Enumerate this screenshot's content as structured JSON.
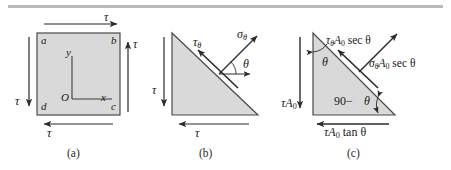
{
  "figure": {
    "type": "mechanics-stress-diagram",
    "top_rule": true,
    "background": "#ffffff",
    "shape_fill": "#d9d9d9",
    "shape_stroke": "#4a4a4a",
    "arrow_color": "#2b2b2b"
  },
  "panels": [
    {
      "id": "a",
      "caption": "(a)",
      "shape": "square",
      "corner_labels": {
        "top_left": "a",
        "top_right": "b",
        "bottom_right": "c",
        "bottom_left": "d"
      },
      "axes": {
        "origin_label": "O",
        "x_label": "x",
        "y_label": "y"
      },
      "arrows": [
        {
          "name": "top-shear-arrow",
          "direction": "right",
          "label": "τ"
        },
        {
          "name": "right-shear-arrow",
          "direction": "up",
          "label": "τ"
        },
        {
          "name": "bottom-shear-arrow",
          "direction": "left",
          "label": "τ"
        },
        {
          "name": "left-shear-arrow",
          "direction": "down",
          "label": "τ"
        }
      ]
    },
    {
      "id": "b",
      "caption": "(b)",
      "shape": "right-triangle",
      "arrows": [
        {
          "name": "left-shear-arrow",
          "direction": "down",
          "label": "τ"
        },
        {
          "name": "bottom-shear-arrow",
          "direction": "left",
          "label": "τ"
        },
        {
          "name": "tau-theta-arrow",
          "direction": "up-left",
          "label_greek": "τ",
          "label_sub": "θ"
        },
        {
          "name": "sigma-theta-arrow",
          "direction": "up-right",
          "label_greek": "σ",
          "label_sub": "θ"
        }
      ],
      "angle_label": "θ"
    },
    {
      "id": "c",
      "caption": "(c)",
      "shape": "right-triangle",
      "arrows": [
        {
          "name": "tau-a0-arrow",
          "direction": "down",
          "label_greek": "τ",
          "label_rest": "A",
          "label_sub": "0"
        },
        {
          "name": "tau-a0-tan-theta-arrow",
          "direction": "left",
          "label_greek": "τ",
          "label_rest": "A",
          "label_sub": "0",
          "label_tail": " tan θ"
        },
        {
          "name": "tau-theta-a0-sec-theta-arrow",
          "direction": "up-left",
          "label_greek": "τ",
          "label_sub_greek": "θ",
          "label_rest": "A",
          "label_sub": "0",
          "label_tail": " sec θ"
        },
        {
          "name": "sigma-theta-a0-sec-theta-arrow",
          "direction": "up-right",
          "label_greek": "σ",
          "label_sub_greek": "θ",
          "label_rest": "A",
          "label_sub": "0",
          "label_tail": " sec θ"
        }
      ],
      "angle_labels": {
        "upper": "θ",
        "lower": "90−",
        "lower_theta": "θ"
      }
    }
  ],
  "text": {
    "tau": "τ",
    "sigma": "σ",
    "theta": "θ",
    "A": "A",
    "zero": "0",
    "sec_theta": " sec θ",
    "tan_theta": " tan θ",
    "ninety_minus": "90−",
    "corner_a": "a",
    "corner_b": "b",
    "corner_c": "c",
    "corner_d": "d",
    "origin": "O",
    "axis_x": "x",
    "axis_y": "y",
    "cap_a": "(a)",
    "cap_b": "(b)",
    "cap_c": "(c)"
  }
}
